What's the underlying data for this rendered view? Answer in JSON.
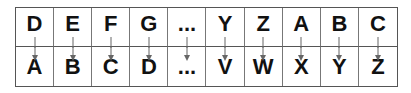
{
  "diagram": {
    "columns": [
      {
        "plain": "D",
        "cipher": "A"
      },
      {
        "plain": "E",
        "cipher": "B"
      },
      {
        "plain": "F",
        "cipher": "C"
      },
      {
        "plain": "G",
        "cipher": "D"
      },
      {
        "plain": "...",
        "cipher": "..."
      },
      {
        "plain": "Y",
        "cipher": "V"
      },
      {
        "plain": "Z",
        "cipher": "W"
      },
      {
        "plain": "A",
        "cipher": "X"
      },
      {
        "plain": "B",
        "cipher": "Y"
      },
      {
        "plain": "C",
        "cipher": "Z"
      }
    ],
    "arrow_icon": "down-arrow-icon",
    "colors": {
      "border": "#555555",
      "arrow": "#666666",
      "text": "#111111"
    }
  }
}
